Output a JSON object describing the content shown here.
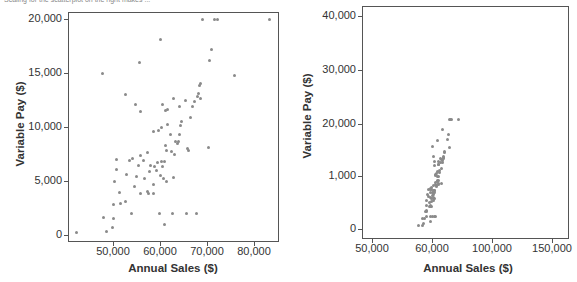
{
  "caption": "Scaling for the scatterplot on the right makes ...",
  "chart_data": [
    {
      "type": "scatter",
      "title": "",
      "xlabel": "Annual Sales ($)",
      "ylabel": "Variable Pay ($)",
      "xlim": [
        41000,
        86000
      ],
      "ylim": [
        -500,
        20800
      ],
      "x_ticks": [
        50000,
        60000,
        70000,
        80000
      ],
      "x_tick_labels": [
        "50,000",
        "60,000",
        "70,000",
        "80,000"
      ],
      "y_ticks": [
        0,
        5000,
        10000,
        15000,
        20000
      ],
      "y_tick_labels": [
        "0",
        "5,000",
        "10,000",
        "15,000",
        "20,000"
      ],
      "grid": false,
      "points": [
        [
          42300,
          200
        ],
        [
          48000,
          1600
        ],
        [
          48700,
          300
        ],
        [
          49800,
          700
        ],
        [
          50100,
          1500
        ],
        [
          50000,
          2800
        ],
        [
          50400,
          5000
        ],
        [
          50700,
          6100
        ],
        [
          50700,
          7000
        ],
        [
          51300,
          3900
        ],
        [
          51500,
          2900
        ],
        [
          52700,
          3100
        ],
        [
          52800,
          5600
        ],
        [
          53600,
          6900
        ],
        [
          53900,
          2000
        ],
        [
          54200,
          7100
        ],
        [
          54500,
          4500
        ],
        [
          55000,
          5400
        ],
        [
          55400,
          6400
        ],
        [
          55800,
          7400
        ],
        [
          55900,
          3800
        ],
        [
          56400,
          6900
        ],
        [
          56800,
          5200
        ],
        [
          57300,
          7600
        ],
        [
          57400,
          4000
        ],
        [
          57600,
          3800
        ],
        [
          57800,
          5900
        ],
        [
          58000,
          6400
        ],
        [
          58600,
          3800
        ],
        [
          58700,
          4700
        ],
        [
          58900,
          6300
        ],
        [
          59300,
          6000
        ],
        [
          59500,
          6700
        ],
        [
          59800,
          2000
        ],
        [
          60000,
          5500
        ],
        [
          60300,
          6800
        ],
        [
          60600,
          6300
        ],
        [
          60700,
          5200
        ],
        [
          60900,
          6800
        ],
        [
          61100,
          8300
        ],
        [
          61300,
          7800
        ],
        [
          61300,
          5000
        ],
        [
          62300,
          9300
        ],
        [
          62500,
          7700
        ],
        [
          62700,
          2000
        ],
        [
          62900,
          5300
        ],
        [
          63100,
          7500
        ],
        [
          63300,
          8700
        ],
        [
          63800,
          8500
        ],
        [
          64000,
          8700
        ],
        [
          64200,
          9300
        ],
        [
          64400,
          10100
        ],
        [
          64500,
          10500
        ],
        [
          65600,
          2000
        ],
        [
          65800,
          8000
        ],
        [
          66000,
          7800
        ],
        [
          66500,
          10900
        ],
        [
          67000,
          11900
        ],
        [
          67300,
          12400
        ],
        [
          67800,
          2000
        ],
        [
          67900,
          12800
        ],
        [
          68200,
          13100
        ],
        [
          68500,
          13800
        ],
        [
          68600,
          14000
        ],
        [
          68700,
          12600
        ],
        [
          69100,
          20000
        ],
        [
          70400,
          8100
        ],
        [
          70600,
          16200
        ],
        [
          71000,
          17200
        ],
        [
          71700,
          20000
        ],
        [
          72300,
          20000
        ],
        [
          75800,
          14800
        ],
        [
          83200,
          20000
        ],
        [
          47800,
          15000
        ],
        [
          55700,
          16000
        ],
        [
          60000,
          18100
        ],
        [
          52600,
          13000
        ],
        [
          54800,
          12100
        ],
        [
          55900,
          11400
        ],
        [
          58700,
          9600
        ],
        [
          59600,
          9700
        ],
        [
          60600,
          12100
        ],
        [
          61500,
          11600
        ],
        [
          62800,
          12600
        ],
        [
          61200,
          11500
        ],
        [
          64100,
          11900
        ],
        [
          65400,
          12500
        ],
        [
          61700,
          10200
        ],
        [
          60300,
          10000
        ],
        [
          60900,
          1000
        ]
      ],
      "point_color": "#8a8a8a"
    },
    {
      "type": "scatter",
      "title": "",
      "xlabel": "Annual Sales ($)",
      "ylabel": "Variable Pay ($)",
      "x_tick_labels": [
        "50,000",
        "60,000",
        "100,000",
        "150,000"
      ],
      "y_tick_labels": [
        "0",
        "1,000",
        "20,000",
        "30,000",
        "40,000"
      ],
      "note": "Non-uniform (misleading) axis scaling; points compressed into narrow band",
      "grid": false,
      "point_color": "#8a8a8a"
    }
  ]
}
